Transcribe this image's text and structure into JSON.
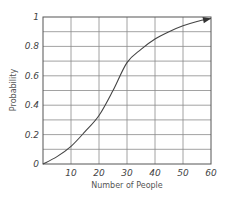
{
  "chart_data": {
    "type": "line",
    "title": "",
    "xlabel": "Number of People",
    "ylabel": "Probability",
    "xlim": [
      0,
      60
    ],
    "ylim": [
      0,
      1
    ],
    "grid": true,
    "x_ticks": [
      "10",
      "20",
      "30",
      "40",
      "50",
      "60"
    ],
    "x_tick_values": [
      10,
      20,
      30,
      40,
      50,
      60
    ],
    "y_ticks": [
      "0",
      "0.2",
      "0.4",
      "0.6",
      "0.8",
      "1"
    ],
    "y_tick_values": [
      0,
      0.2,
      0.4,
      0.6,
      0.8,
      1
    ],
    "series": [
      {
        "name": "Probability",
        "x": [
          0,
          5,
          10,
          15,
          20,
          25,
          30,
          35,
          40,
          45,
          50,
          55,
          60
        ],
        "y": [
          0,
          0.05,
          0.12,
          0.22,
          0.33,
          0.5,
          0.69,
          0.78,
          0.85,
          0.9,
          0.94,
          0.97,
          0.99
        ],
        "arrow_end": true
      }
    ],
    "colors": {
      "line": "#444444",
      "grid": "#8a8a8a",
      "frame": "#555555"
    }
  }
}
